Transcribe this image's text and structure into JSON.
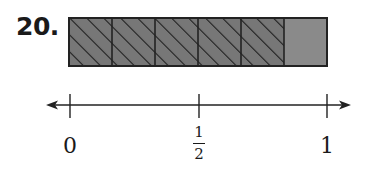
{
  "problem": {
    "number": "20."
  },
  "fraction_bar": {
    "total_parts": 6,
    "shaded_parts": 5,
    "hatched_fill": "#777777",
    "unhatched_fill": "#8a8a8a",
    "stroke": "#222222"
  },
  "number_line": {
    "labels": [
      {
        "value": 0,
        "text": "0"
      },
      {
        "value": 0.5,
        "numerator": "1",
        "denominator": "2"
      },
      {
        "value": 1,
        "text": "1"
      }
    ]
  }
}
